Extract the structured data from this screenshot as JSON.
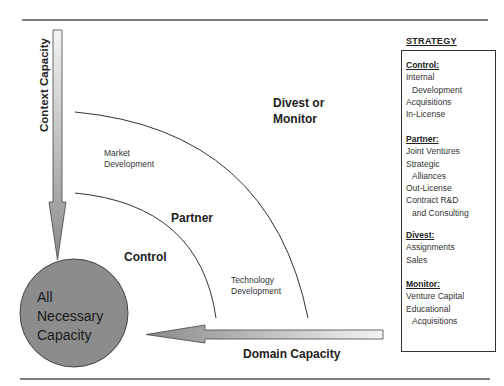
{
  "diagram": {
    "axes": {
      "vertical_label": "Context Capacity",
      "horizontal_label": "Domain Capacity"
    },
    "center": {
      "lines": [
        "All",
        "Necessary",
        "Capacity"
      ],
      "fill_color": "#8c8c8c"
    },
    "regions": {
      "control": "Control",
      "partner": "Partner",
      "divest_line1": "Divest or",
      "divest_line2": "Monitor"
    },
    "annotations": {
      "market_line1": "Market",
      "market_line2": "Development",
      "tech_line1": "Technology",
      "tech_line2": "Development"
    },
    "strategy": {
      "title": "STRATEGY",
      "sections": [
        {
          "heading": "Control:",
          "items": [
            "Internal",
            "Development",
            "Acquisitions",
            "In-License"
          ]
        },
        {
          "heading": "Partner:",
          "items": [
            "Joint Ventures",
            "Strategic",
            "Alliances",
            "Out-License",
            "Contract R&D",
            "and Consulting"
          ]
        },
        {
          "heading": "Divest:",
          "items": [
            "Assignments",
            "Sales"
          ]
        },
        {
          "heading": "Monitor:",
          "items": [
            "Venture Capital",
            "Educational",
            "Acquisitions"
          ]
        }
      ]
    }
  }
}
